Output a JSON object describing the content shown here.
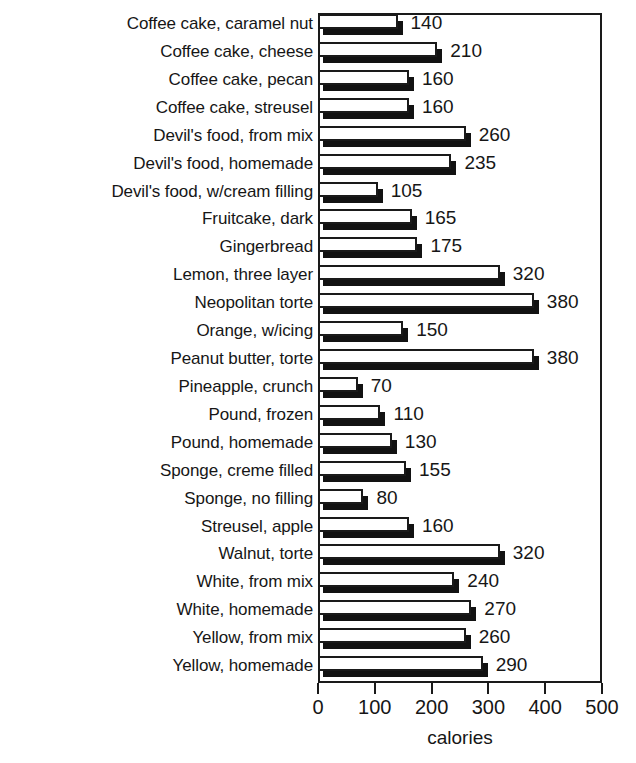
{
  "chart_data": {
    "type": "bar",
    "orientation": "horizontal",
    "title": "",
    "xlabel": "calories",
    "ylabel": "",
    "xlim": [
      0,
      500
    ],
    "xticks": [
      0,
      100,
      200,
      300,
      400,
      500
    ],
    "xtick_labels": [
      "0",
      "100",
      "200",
      "300",
      "400",
      "500"
    ],
    "grid": false,
    "legend": null,
    "bar_style": "white-fill-black-outline-with-3d-shadow",
    "categories": [
      "Coffee cake, caramel nut",
      "Coffee cake, cheese",
      "Coffee cake, pecan",
      "Coffee cake, streusel",
      "Devil's food, from mix",
      "Devil's food, homemade",
      "Devil's food, w/cream filling",
      "Fruitcake, dark",
      "Gingerbread",
      "Lemon, three layer",
      "Neopolitan torte",
      "Orange, w/icing",
      "Peanut butter, torte",
      "Pineapple, crunch",
      "Pound, frozen",
      "Pound, homemade",
      "Sponge, creme filled",
      "Sponge, no filling",
      "Streusel, apple",
      "Walnut, torte",
      "White, from mix",
      "White, homemade",
      "Yellow, from mix",
      "Yellow, homemade"
    ],
    "values": [
      140,
      210,
      160,
      160,
      260,
      235,
      105,
      165,
      175,
      320,
      380,
      150,
      380,
      70,
      110,
      130,
      155,
      80,
      160,
      320,
      240,
      270,
      260,
      290
    ],
    "value_labels": [
      "140",
      "210",
      "160",
      "160",
      "260",
      "235",
      "105",
      "165",
      "175",
      "320",
      "380",
      "150",
      "380",
      "70",
      "110",
      "130",
      "155",
      "80",
      "160",
      "320",
      "240",
      "270",
      "260",
      "290"
    ]
  }
}
